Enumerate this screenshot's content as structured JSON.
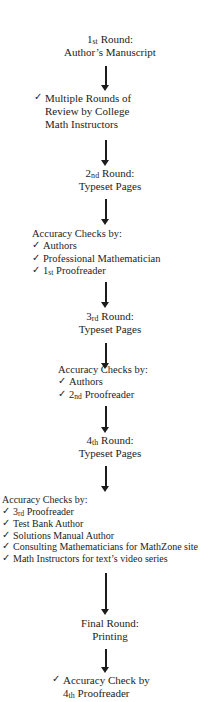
{
  "diagram": {
    "check_glyph": "✓",
    "text_color": "#1c1c1c",
    "background_color": "#ffffff",
    "arrow_color": "#1c1c1c",
    "nodes": [
      {
        "id": "round-1",
        "kind": "stage",
        "lines": [
          {
            "text": "1",
            "ordinal": "st",
            "tail": " Round:"
          },
          {
            "text": "Author’s Manuscript"
          }
        ]
      },
      {
        "id": "multiple-rounds-review",
        "kind": "check-list",
        "items": [
          {
            "check": true,
            "text": "Multiple Rounds of"
          },
          {
            "check": false,
            "text": "Review by College"
          },
          {
            "check": false,
            "text": "Math Instructors"
          }
        ]
      },
      {
        "id": "round-2",
        "kind": "stage",
        "lines": [
          {
            "text": "2",
            "ordinal": "nd",
            "tail": " Round:"
          },
          {
            "text": "Typeset Pages"
          }
        ]
      },
      {
        "id": "accuracy-checks-1",
        "kind": "check-list",
        "heading": "Accuracy Checks by:",
        "items": [
          {
            "check": true,
            "text": "Authors"
          },
          {
            "check": true,
            "text": "Professional Mathematician"
          },
          {
            "check": true,
            "text": "1",
            "ordinal": "st",
            "tail": " Proofreader"
          }
        ]
      },
      {
        "id": "round-3",
        "kind": "stage",
        "lines": [
          {
            "text": "3",
            "ordinal": "rd",
            "tail": " Round:"
          },
          {
            "text": "Typeset Pages"
          }
        ]
      },
      {
        "id": "accuracy-checks-2",
        "kind": "check-list",
        "heading": "Accuracy Checks by:",
        "items": [
          {
            "check": true,
            "text": "Authors"
          },
          {
            "check": true,
            "text": "2",
            "ordinal": "nd",
            "tail": " Proofreader"
          }
        ]
      },
      {
        "id": "round-4",
        "kind": "stage",
        "lines": [
          {
            "text": "4",
            "ordinal": "th",
            "tail": " Round:"
          },
          {
            "text": "Typeset Pages"
          }
        ]
      },
      {
        "id": "accuracy-checks-3",
        "kind": "check-list",
        "heading": "Accuracy Checks by:",
        "items": [
          {
            "check": true,
            "text": "3",
            "ordinal": "rd",
            "tail": " Proofreader"
          },
          {
            "check": true,
            "text": "Test Bank Author"
          },
          {
            "check": true,
            "text": "Solutions Manual Author"
          },
          {
            "check": true,
            "text": "Consulting Mathematicians for MathZone site"
          },
          {
            "check": true,
            "text": "Math Instructors for text’s video series"
          }
        ]
      },
      {
        "id": "final-round",
        "kind": "stage",
        "lines": [
          {
            "text": "Final Round:"
          },
          {
            "text": "Printing"
          }
        ]
      },
      {
        "id": "final-accuracy-check",
        "kind": "check-list",
        "items": [
          {
            "check": true,
            "text": "Accuracy Check by"
          },
          {
            "check": false,
            "text": "4",
            "ordinal": "th",
            "tail": " Proofreader"
          }
        ]
      }
    ],
    "connectors": [
      {
        "id": "arrow-1",
        "from": "round-1",
        "to": "multiple-rounds-review"
      },
      {
        "id": "arrow-2",
        "from": "multiple-rounds-review",
        "to": "round-2"
      },
      {
        "id": "arrow-3",
        "from": "round-2",
        "to": "accuracy-checks-1"
      },
      {
        "id": "arrow-4",
        "from": "accuracy-checks-1",
        "to": "round-3"
      },
      {
        "id": "arrow-5",
        "from": "round-3",
        "to": "accuracy-checks-2"
      },
      {
        "id": "arrow-6",
        "from": "accuracy-checks-2",
        "to": "round-4"
      },
      {
        "id": "arrow-7",
        "from": "round-4",
        "to": "accuracy-checks-3"
      },
      {
        "id": "arrow-8",
        "from": "accuracy-checks-3",
        "to": "final-round"
      },
      {
        "id": "arrow-9",
        "from": "final-round",
        "to": "final-accuracy-check"
      }
    ]
  }
}
